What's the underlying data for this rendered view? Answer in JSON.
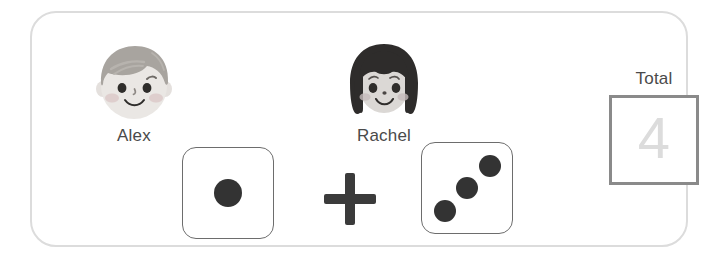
{
  "panel": {
    "background_color": "#ffffff",
    "border_color": "#dcdcdc"
  },
  "players": [
    {
      "name": "Alex",
      "avatar_icon": "boy-face-icon",
      "hair_color": "#a8a49f",
      "skin_color": "#e9e6e3",
      "cheek_color": "#d9c9c9"
    },
    {
      "name": "Rachel",
      "avatar_icon": "girl-face-icon",
      "hair_color": "#2e2c2b",
      "skin_color": "#d9d6d3",
      "cheek_color": "#c3b9b9"
    }
  ],
  "equation": {
    "dice": [
      {
        "die_icon": "die-face-icon",
        "value": 1,
        "pip_color": "#333333",
        "border_color": "#6d6d6d",
        "pips": [
          "center"
        ]
      },
      {
        "die_icon": "die-face-icon",
        "value": 3,
        "pip_color": "#333333",
        "border_color": "#6d6d6d",
        "pips": [
          "bottom-left",
          "center",
          "top-right"
        ]
      }
    ],
    "operator": "+",
    "operator_icon": "plus-icon",
    "operator_color": "#3b3b3b"
  },
  "total": {
    "label": "Total",
    "value": "4",
    "value_color": "#dcdcdc",
    "box_border_color": "#8a8a8a"
  }
}
